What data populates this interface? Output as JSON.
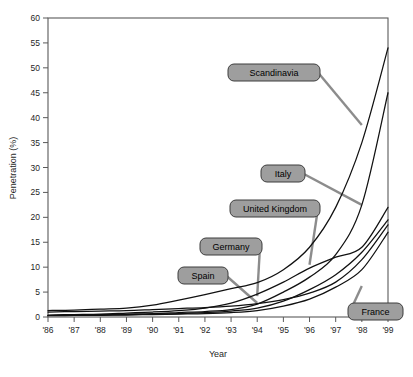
{
  "chart_data": {
    "type": "line",
    "title": "",
    "xlabel": "Year",
    "ylabel": "Penetration (%)",
    "xlim": [
      1986,
      1999
    ],
    "ylim": [
      0,
      60
    ],
    "ytick_step": 5,
    "grid": false,
    "legend_position": "inline-callouts",
    "x": [
      1986,
      1987,
      1988,
      1989,
      1990,
      1991,
      1992,
      1993,
      1994,
      1995,
      1996,
      1997,
      1998,
      1999
    ],
    "xtick_labels": [
      "'86",
      "'87",
      "'88",
      "'89",
      "'90",
      "'91",
      "'92",
      "'93",
      "'94",
      "'95",
      "'96",
      "'97",
      "'98",
      "'99"
    ],
    "ytick_labels": [
      "0",
      "5",
      "10",
      "15",
      "20",
      "25",
      "30",
      "35",
      "40",
      "45",
      "50",
      "55",
      "60"
    ],
    "ytick_values": [
      0,
      5,
      10,
      15,
      20,
      25,
      30,
      35,
      40,
      45,
      50,
      55,
      60
    ],
    "series": [
      {
        "name": "Scandinavia",
        "values": [
          1.3,
          1.4,
          1.6,
          1.8,
          2.4,
          3.4,
          4.5,
          5.7,
          6.9,
          9.5,
          14.0,
          22.0,
          35.0,
          54.0
        ]
      },
      {
        "name": "Italy",
        "values": [
          0.3,
          0.4,
          0.5,
          0.6,
          0.7,
          0.9,
          1.1,
          1.5,
          2.6,
          5.0,
          8.0,
          12.5,
          22.5,
          45.0
        ]
      },
      {
        "name": "United Kingdom",
        "values": [
          0.4,
          0.5,
          0.6,
          0.8,
          1.0,
          1.3,
          1.8,
          2.8,
          4.6,
          7.0,
          9.8,
          12.0,
          14.0,
          22.0
        ]
      },
      {
        "name": "Germany",
        "values": [
          0.3,
          0.35,
          0.4,
          0.5,
          0.6,
          0.7,
          0.9,
          1.2,
          1.8,
          3.2,
          5.5,
          8.5,
          13.0,
          19.5
        ]
      },
      {
        "name": "Spain",
        "values": [
          1.0,
          1.1,
          1.2,
          1.3,
          1.5,
          1.7,
          1.9,
          2.2,
          2.7,
          3.5,
          4.8,
          7.0,
          11.5,
          18.5
        ]
      },
      {
        "name": "France",
        "values": [
          0.25,
          0.3,
          0.35,
          0.4,
          0.5,
          0.6,
          0.7,
          0.9,
          1.3,
          2.2,
          3.6,
          6.0,
          9.5,
          17.0
        ]
      }
    ],
    "callouts": [
      {
        "label": "Scandinavia",
        "target_year": 1998,
        "target_value": 38.5
      },
      {
        "label": "Italy",
        "target_year": 1998,
        "target_value": 22.5
      },
      {
        "label": "United Kingdom",
        "target_year": 1996,
        "target_value": 10.5
      },
      {
        "label": "Germany",
        "target_year": 1994,
        "target_value": 4.2
      },
      {
        "label": "Spain",
        "target_year": 1994,
        "target_value": 2.8
      },
      {
        "label": "France",
        "target_year": 1998,
        "target_value": 6.2
      }
    ]
  },
  "colors": {
    "line": "#111111",
    "callout_fill": "#9e9e9e",
    "callout_stroke": "#3d3d3d",
    "axis": "#5a5a5a",
    "background": "#ffffff"
  }
}
